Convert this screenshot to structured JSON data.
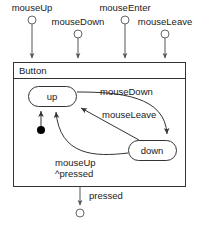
{
  "diagram": {
    "type": "uml-statechart",
    "region": {
      "title": "Button"
    },
    "ports_top": [
      {
        "name": "mouseUp",
        "label": "mouseUp",
        "cx": 32,
        "cy": 20,
        "label_x": 32,
        "label_y": 11,
        "anchor": "middle",
        "arrow_to_y": 62
      },
      {
        "name": "mouseDown",
        "label": "mouseDown",
        "cx": 78,
        "cy": 34,
        "label_x": 78,
        "label_y": 25,
        "anchor": "middle",
        "arrow_to_y": 62
      },
      {
        "name": "mouseEnter",
        "label": "mouseEnter",
        "cx": 125,
        "cy": 20,
        "label_x": 125,
        "label_y": 11,
        "anchor": "middle",
        "arrow_to_y": 62
      },
      {
        "name": "mouseLeave",
        "label": "mouseLeave",
        "cx": 165,
        "cy": 34,
        "label_x": 165,
        "label_y": 25,
        "anchor": "middle",
        "arrow_to_y": 62
      }
    ],
    "states": [
      {
        "name": "up",
        "label": "up",
        "x": 28,
        "y": 86,
        "w": 48,
        "h": 20,
        "rx": 10
      },
      {
        "name": "down",
        "label": "down",
        "x": 128,
        "y": 140,
        "w": 48,
        "h": 20,
        "rx": 10
      }
    ],
    "initial": {
      "cx": 41,
      "cy": 130,
      "r": 4
    },
    "transitions": [
      {
        "name": "mouseDown",
        "label": "mouseDown",
        "label_x": 100,
        "label_y": 95
      },
      {
        "name": "mouseLeave",
        "label": "mouseLeave",
        "label_x": 102,
        "label_y": 118
      },
      {
        "name": "mouseUp",
        "label": "mouseUp",
        "label_x": 55,
        "label_y": 166
      },
      {
        "name": "pressed-action",
        "label": "^pressed",
        "label_x": 55,
        "label_y": 177
      }
    ],
    "exit_port": {
      "name": "pressed",
      "label": "pressed",
      "cx": 80,
      "cy": 213,
      "label_x": 89,
      "label_y": 199,
      "arrow_from_y": 187,
      "arrow_to_y": 208
    },
    "colors": {
      "background": "#ffffff",
      "line": "#555555",
      "shape": "#333333",
      "text": "#1a1a1a",
      "init_dot": "#000000"
    }
  }
}
